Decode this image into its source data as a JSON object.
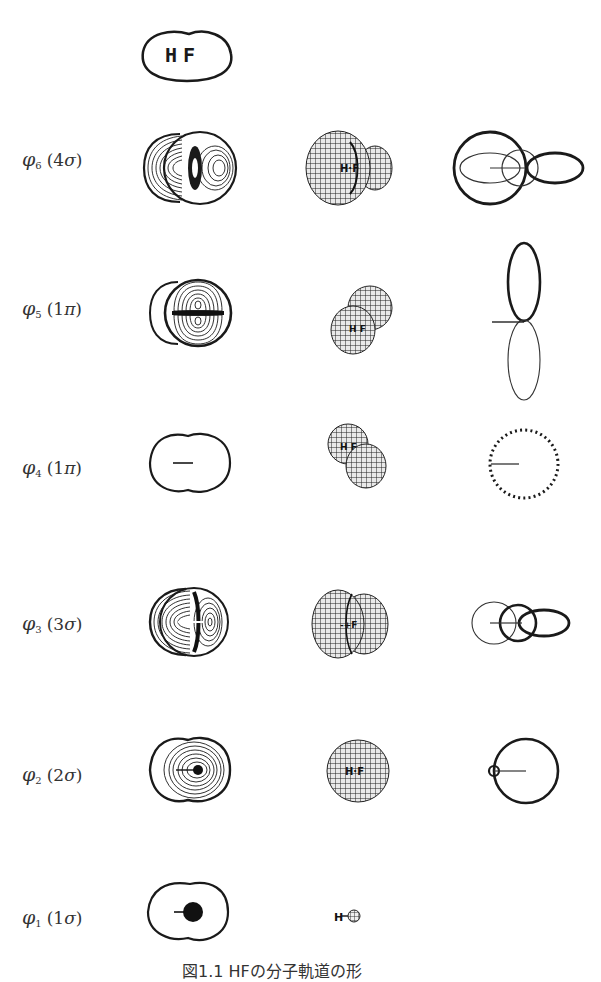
{
  "figure": {
    "molecule_label": {
      "h": "H",
      "f": "F"
    },
    "caption": "図1.1  HFの分子軌道の形",
    "columns": [
      "contour-map",
      "3d-surface",
      "polar-plot"
    ],
    "rows": [
      {
        "id": "phi6",
        "symbol": "φ",
        "index": "6",
        "designation": "(4σ)",
        "num": "4",
        "sym": "σ"
      },
      {
        "id": "phi5",
        "symbol": "φ",
        "index": "5",
        "designation": "(1π)",
        "num": "1",
        "sym": "π"
      },
      {
        "id": "phi4",
        "symbol": "φ",
        "index": "4",
        "designation": "(1π)",
        "num": "1",
        "sym": "π"
      },
      {
        "id": "phi3",
        "symbol": "φ",
        "index": "3",
        "designation": "(3σ)",
        "num": "3",
        "sym": "σ"
      },
      {
        "id": "phi2",
        "symbol": "φ",
        "index": "2",
        "designation": "(2σ)",
        "num": "2",
        "sym": "σ"
      },
      {
        "id": "phi1",
        "symbol": "φ",
        "index": "1",
        "designation": "(1σ)",
        "num": "1",
        "sym": "σ"
      }
    ],
    "mesh_labels": {
      "h": "H",
      "f": "F"
    },
    "colors": {
      "ink": "#1a1a1a",
      "background": "#ffffff",
      "label": "#333333"
    }
  }
}
